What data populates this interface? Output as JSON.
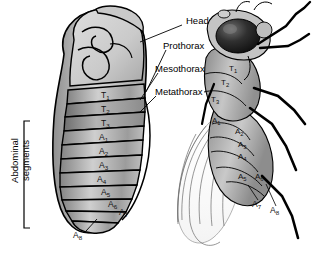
{
  "figure": {
    "background": "#ffffff",
    "ink": "#000000",
    "title_labels": [
      {
        "id": "head",
        "text": "Head",
        "x": 186,
        "y": 22
      },
      {
        "id": "prothorax",
        "text": "Prothorax",
        "x": 168,
        "y": 47
      },
      {
        "id": "mesothorax",
        "text": "Mesothorax",
        "x": 160,
        "y": 70
      },
      {
        "id": "metathorax",
        "text": "Metathorax",
        "x": 160,
        "y": 93
      }
    ],
    "bracket_label": {
      "line1": "Abdominal",
      "line2": "segments"
    }
  },
  "larva": {
    "name": "drosophila-larva",
    "segments": [
      {
        "id": "T1",
        "letter": "T",
        "num": "1",
        "x": 101,
        "y": 97
      },
      {
        "id": "T2",
        "letter": "T",
        "num": "2",
        "x": 101,
        "y": 111
      },
      {
        "id": "T3",
        "letter": "T",
        "num": "3",
        "x": 101,
        "y": 125
      },
      {
        "id": "A1",
        "letter": "A",
        "num": "1",
        "x": 99,
        "y": 139
      },
      {
        "id": "A2",
        "letter": "A",
        "num": "2",
        "x": 99,
        "y": 152
      },
      {
        "id": "A3",
        "letter": "A",
        "num": "3",
        "x": 99,
        "y": 167
      },
      {
        "id": "A4",
        "letter": "A",
        "num": "4",
        "x": 98,
        "y": 181
      },
      {
        "id": "A5",
        "letter": "A",
        "num": "5",
        "x": 102,
        "y": 193
      },
      {
        "id": "A6",
        "letter": "A",
        "num": "6",
        "x": 109,
        "y": 205
      },
      {
        "id": "A7",
        "letter": "A",
        "num": "7",
        "x": 120,
        "y": 213
      },
      {
        "id": "A8",
        "letter": "A",
        "num": "8",
        "x": 75,
        "y": 236
      }
    ]
  },
  "fly": {
    "name": "drosophila-adult",
    "segments": [
      {
        "id": "T1",
        "letter": "T",
        "num": "1",
        "x": 229,
        "y": 70
      },
      {
        "id": "T2",
        "letter": "T",
        "num": "2",
        "x": 222,
        "y": 84
      },
      {
        "id": "T3",
        "letter": "T",
        "num": "3",
        "x": 213,
        "y": 101
      },
      {
        "id": "A1",
        "letter": "A",
        "num": "1",
        "x": 214,
        "y": 122
      },
      {
        "id": "A2",
        "letter": "A",
        "num": "2",
        "x": 237,
        "y": 133
      },
      {
        "id": "A3",
        "letter": "A",
        "num": "3",
        "x": 240,
        "y": 146
      },
      {
        "id": "A4",
        "letter": "A",
        "num": "4",
        "x": 240,
        "y": 158
      },
      {
        "id": "A5",
        "letter": "A",
        "num": "5",
        "x": 240,
        "y": 178
      },
      {
        "id": "A6",
        "letter": "A",
        "num": "6",
        "x": 257,
        "y": 178
      },
      {
        "id": "A7",
        "letter": "A",
        "num": "7",
        "x": 255,
        "y": 205
      },
      {
        "id": "A8",
        "letter": "A",
        "num": "8",
        "x": 273,
        "y": 211
      }
    ]
  }
}
